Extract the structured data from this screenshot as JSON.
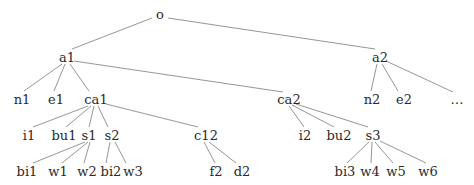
{
  "diagram": {
    "type": "tree",
    "nodes": [
      {
        "id": "o",
        "label": "o",
        "x": 160,
        "y": 14
      },
      {
        "id": "a1",
        "label": "a1",
        "x": 67,
        "y": 57
      },
      {
        "id": "a2",
        "label": "a2",
        "x": 380,
        "y": 57
      },
      {
        "id": "n1",
        "label": "n1",
        "x": 22,
        "y": 99
      },
      {
        "id": "e1",
        "label": "e1",
        "x": 56,
        "y": 99
      },
      {
        "id": "ca1",
        "label": "ca1",
        "x": 96,
        "y": 99
      },
      {
        "id": "ca2",
        "label": "ca2",
        "x": 289,
        "y": 99
      },
      {
        "id": "n2",
        "label": "n2",
        "x": 372,
        "y": 99
      },
      {
        "id": "e2",
        "label": "e2",
        "x": 404,
        "y": 99
      },
      {
        "id": "more",
        "label": "…",
        "x": 457,
        "y": 99
      },
      {
        "id": "i1",
        "label": "i1",
        "x": 29,
        "y": 135
      },
      {
        "id": "bu1",
        "label": "bu1",
        "x": 64,
        "y": 135
      },
      {
        "id": "s1",
        "label": "s1",
        "x": 89,
        "y": 135
      },
      {
        "id": "s2",
        "label": "s2",
        "x": 112,
        "y": 135
      },
      {
        "id": "c12",
        "label": "c12",
        "x": 206,
        "y": 135
      },
      {
        "id": "i2",
        "label": "i2",
        "x": 305,
        "y": 135
      },
      {
        "id": "bu2",
        "label": "bu2",
        "x": 339,
        "y": 135
      },
      {
        "id": "s3",
        "label": "s3",
        "x": 373,
        "y": 135
      },
      {
        "id": "bi1",
        "label": "bi1",
        "x": 27,
        "y": 171
      },
      {
        "id": "w1",
        "label": "w1",
        "x": 58,
        "y": 171
      },
      {
        "id": "w2",
        "label": "w2",
        "x": 87,
        "y": 171
      },
      {
        "id": "bi2",
        "label": "bi2",
        "x": 111,
        "y": 171
      },
      {
        "id": "w3",
        "label": "w3",
        "x": 133,
        "y": 171
      },
      {
        "id": "f2",
        "label": "f2",
        "x": 216,
        "y": 171
      },
      {
        "id": "d2",
        "label": "d2",
        "x": 242,
        "y": 171
      },
      {
        "id": "bi3",
        "label": "bi3",
        "x": 345,
        "y": 171
      },
      {
        "id": "w4",
        "label": "w4",
        "x": 370,
        "y": 171
      },
      {
        "id": "w5",
        "label": "w5",
        "x": 396,
        "y": 171
      },
      {
        "id": "w6",
        "label": "w6",
        "x": 428,
        "y": 171
      }
    ],
    "edges": [
      {
        "from": "o",
        "to": "a1",
        "x1": 152,
        "y1": 18,
        "x2": 72,
        "y2": 49
      },
      {
        "from": "o",
        "to": "a2",
        "x1": 168,
        "y1": 18,
        "x2": 375,
        "y2": 49
      },
      {
        "from": "a1",
        "to": "n1",
        "x1": 62,
        "y1": 64,
        "x2": 24,
        "y2": 91
      },
      {
        "from": "a1",
        "to": "e1",
        "x1": 65,
        "y1": 64,
        "x2": 54,
        "y2": 91
      },
      {
        "from": "a1",
        "to": "ca1",
        "x1": 70,
        "y1": 64,
        "x2": 89,
        "y2": 91
      },
      {
        "from": "a1",
        "to": "ca2",
        "x1": 74,
        "y1": 61,
        "x2": 283,
        "y2": 92
      },
      {
        "from": "a2",
        "to": "n2",
        "x1": 377,
        "y1": 64,
        "x2": 371,
        "y2": 91
      },
      {
        "from": "a2",
        "to": "e2",
        "x1": 382,
        "y1": 64,
        "x2": 398,
        "y2": 91
      },
      {
        "from": "a2",
        "to": "more",
        "x1": 386,
        "y1": 61,
        "x2": 453,
        "y2": 92
      },
      {
        "from": "ca1",
        "to": "i1",
        "x1": 88,
        "y1": 106,
        "x2": 33,
        "y2": 127
      },
      {
        "from": "ca1",
        "to": "bu1",
        "x1": 91,
        "y1": 106,
        "x2": 66,
        "y2": 127
      },
      {
        "from": "ca1",
        "to": "s1",
        "x1": 94,
        "y1": 106,
        "x2": 89,
        "y2": 127
      },
      {
        "from": "ca1",
        "to": "s2",
        "x1": 98,
        "y1": 106,
        "x2": 108,
        "y2": 127
      },
      {
        "from": "ca1",
        "to": "c12",
        "x1": 106,
        "y1": 104,
        "x2": 198,
        "y2": 127
      },
      {
        "from": "ca2",
        "to": "i2",
        "x1": 289,
        "y1": 106,
        "x2": 304,
        "y2": 127
      },
      {
        "from": "ca2",
        "to": "bu2",
        "x1": 292,
        "y1": 105,
        "x2": 334,
        "y2": 127
      },
      {
        "from": "ca2",
        "to": "s3",
        "x1": 296,
        "y1": 104,
        "x2": 368,
        "y2": 127
      },
      {
        "from": "s1",
        "to": "bi1",
        "x1": 85,
        "y1": 142,
        "x2": 33,
        "y2": 163
      },
      {
        "from": "s1",
        "to": "w1",
        "x1": 88,
        "y1": 142,
        "x2": 62,
        "y2": 163
      },
      {
        "from": "s1",
        "to": "w2",
        "x1": 90,
        "y1": 142,
        "x2": 84,
        "y2": 163
      },
      {
        "from": "s2",
        "to": "bi2",
        "x1": 110,
        "y1": 142,
        "x2": 106,
        "y2": 163
      },
      {
        "from": "s2",
        "to": "w3",
        "x1": 115,
        "y1": 142,
        "x2": 126,
        "y2": 163
      },
      {
        "from": "c12",
        "to": "f2",
        "x1": 204,
        "y1": 142,
        "x2": 215,
        "y2": 163
      },
      {
        "from": "c12",
        "to": "d2",
        "x1": 209,
        "y1": 142,
        "x2": 236,
        "y2": 163
      },
      {
        "from": "s3",
        "to": "bi3",
        "x1": 369,
        "y1": 142,
        "x2": 347,
        "y2": 163
      },
      {
        "from": "s3",
        "to": "w4",
        "x1": 372,
        "y1": 142,
        "x2": 371,
        "y2": 163
      },
      {
        "from": "s3",
        "to": "w5",
        "x1": 375,
        "y1": 142,
        "x2": 393,
        "y2": 163
      },
      {
        "from": "s3",
        "to": "w6",
        "x1": 380,
        "y1": 141,
        "x2": 426,
        "y2": 163
      }
    ]
  }
}
